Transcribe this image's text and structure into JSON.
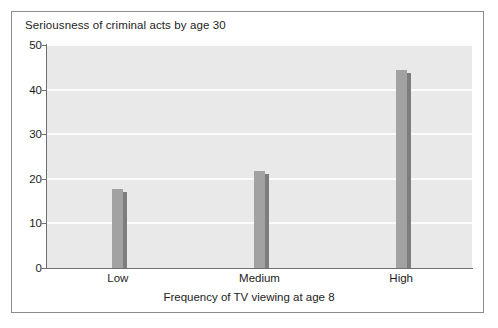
{
  "chart_data": {
    "type": "bar",
    "title": "Seriousness of criminal acts by age 30",
    "xlabel": "Frequency of TV viewing at age 8",
    "ylabel": "",
    "categories": [
      "Low",
      "Medium",
      "High"
    ],
    "values": [
      17.7,
      21.7,
      44.5
    ],
    "ylim": [
      0,
      50
    ],
    "yticks": [
      0,
      10,
      20,
      30,
      40,
      50
    ],
    "ytick_labels": [
      "0",
      "10",
      "20",
      "30",
      "40",
      "50"
    ],
    "grid": true,
    "legend": null,
    "colors": {
      "bar_fill": "#a2a2a2",
      "bar_shadow": "#7d7d7d",
      "plot_background": "#e9e9e9",
      "gridline": "#fbfbfb",
      "axis": "#6f6f6f",
      "frame": "#8c8c8c",
      "text": "#1d1d1d",
      "page_background": "#ffffff"
    }
  }
}
